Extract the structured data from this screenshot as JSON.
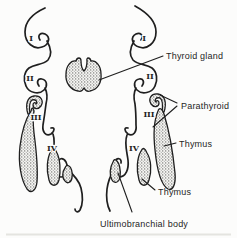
{
  "figure": {
    "labels": {
      "thyroid_gland": "Thyroid gland",
      "parathyroid": "Parathyroid",
      "thymus_upper": "Thymus",
      "thymus_lower": "Thymus",
      "ultimobranchial_body": "Ultimobranchial body"
    },
    "pouch_numerals": {
      "left": [
        "I",
        "II",
        "III",
        "IV"
      ],
      "right": [
        "I",
        "II",
        "III",
        "IV"
      ]
    },
    "colors": {
      "ink": "#1f1f1f",
      "paper": "#fcfcfb",
      "stipple_dot": "#3f3f3f"
    }
  }
}
